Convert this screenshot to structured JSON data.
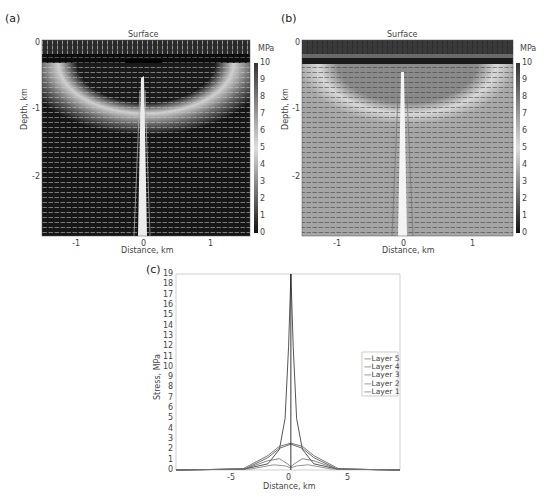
{
  "chart_data": [
    {
      "panel": "(a)",
      "type": "heatmap",
      "title": "Surface",
      "xlabel": "Distance, km",
      "ylabel": "Depth, km",
      "xticks": [
        "-1",
        "0",
        "1"
      ],
      "yticks": [
        "0",
        "-1",
        "-2"
      ],
      "xlim": [
        -1.5,
        1.6
      ],
      "ylim": [
        -2.9,
        0
      ],
      "colorbar": {
        "label": "MPa",
        "ticks": [
          "0",
          "1",
          "2",
          "3",
          "4",
          "5",
          "6",
          "7",
          "8",
          "9",
          "10"
        ],
        "range": [
          0,
          10
        ],
        "colormap": "grayscale (dark=high)"
      },
      "overlay": "stress direction vectors (white)"
    },
    {
      "panel": "(b)",
      "type": "heatmap",
      "title": "Surface",
      "xlabel": "Distance, km",
      "ylabel": "Depth, km",
      "xticks": [
        "-1",
        "0",
        "1"
      ],
      "yticks": [
        "0",
        "-1",
        "-2"
      ],
      "xlim": [
        -1.5,
        1.6
      ],
      "ylim": [
        -2.9,
        0
      ],
      "colorbar": {
        "label": "MPa",
        "ticks": [
          "0",
          "1",
          "2",
          "3",
          "4",
          "5",
          "6",
          "7",
          "8",
          "9",
          "10"
        ],
        "range": [
          0,
          10
        ],
        "colormap": "grayscale (dark=high)"
      },
      "overlay": "stress direction vectors (dark)"
    },
    {
      "panel": "(c)",
      "type": "line",
      "xlabel": "Distance, km",
      "ylabel": "Stress, MPa",
      "xticks": [
        "-5",
        "0",
        "5"
      ],
      "yticks": [
        "0",
        "1",
        "2",
        "3",
        "4",
        "5",
        "6",
        "7",
        "8",
        "9",
        "10",
        "11",
        "12",
        "13",
        "14",
        "15",
        "16",
        "17",
        "18",
        "19"
      ],
      "xlim": [
        -10,
        9.5
      ],
      "ylim": [
        0,
        19
      ],
      "legend": [
        "Layer 5",
        "Layer 4",
        "Layer 3",
        "Layer 2",
        "Layer 1"
      ],
      "legend_position": "right",
      "series": [
        {
          "name": "Layer 5",
          "x": [
            -10,
            -4,
            -2,
            -1,
            -0.5,
            -0.2,
            0,
            0.2,
            0.5,
            1,
            2,
            4,
            9.5
          ],
          "values": [
            0,
            0.1,
            0.6,
            2,
            5,
            12,
            19,
            12,
            5,
            2,
            0.6,
            0.1,
            0
          ]
        },
        {
          "name": "Layer 4",
          "x": [
            -10,
            -4,
            -2,
            -1,
            0,
            1,
            2,
            4,
            9.5
          ],
          "values": [
            0,
            0.1,
            1.2,
            2.1,
            2.5,
            2.1,
            1.2,
            0.1,
            0
          ]
        },
        {
          "name": "Layer 3",
          "x": [
            -10,
            -4.2,
            -2,
            -1,
            0,
            1,
            2,
            4.2,
            9.5
          ],
          "values": [
            0,
            0.1,
            1.4,
            2.3,
            2.6,
            2.3,
            1.4,
            0.1,
            0
          ]
        },
        {
          "name": "Layer 2",
          "x": [
            -10,
            -4,
            -2,
            -1,
            -0.3,
            0,
            0.3,
            1,
            2,
            4,
            9.5
          ],
          "values": [
            0,
            0.1,
            0.9,
            1.1,
            0.6,
            0.3,
            0.6,
            1.1,
            0.9,
            0.1,
            0
          ]
        },
        {
          "name": "Layer 1",
          "x": [
            -10,
            -3.5,
            -1.5,
            -0.5,
            0,
            0.5,
            1.5,
            3.5,
            9.5
          ],
          "values": [
            0,
            0.1,
            0.5,
            0.4,
            0.2,
            0.4,
            0.5,
            0.1,
            0
          ]
        }
      ]
    }
  ],
  "labels": {
    "a": "(a)",
    "b": "(b)",
    "c": "(c)",
    "surface": "Surface",
    "mpa": "MPa",
    "distance": "Distance, km",
    "depth": "Depth, km",
    "stress": "Stress, MPa"
  }
}
